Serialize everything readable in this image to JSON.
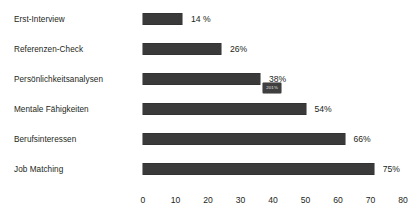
{
  "chart_data": {
    "type": "bar",
    "orientation": "horizontal",
    "title": "",
    "xlabel": "",
    "ylabel": "",
    "xlim": [
      0,
      80
    ],
    "xticks": [
      "0",
      "10",
      "20",
      "30",
      "40",
      "50",
      "60",
      "70",
      "80"
    ],
    "grid": false,
    "legend": "none",
    "bar_color": "#3a3a3a",
    "background_color": "#ffffff",
    "text_color": "#231f20",
    "categories": [
      "Erst-Interview",
      "Referenzen-Check",
      "Persönlichkeitsanalysen",
      "Mentale Fähigkeiten",
      "Berufsinteressen",
      "Job Matching"
    ],
    "values": [
      12,
      24,
      36,
      50,
      62,
      71
    ],
    "data_labels": [
      "14 %",
      "26%",
      "38%",
      "54%",
      "66%",
      "75%"
    ],
    "annotations": [
      {
        "text": "201%",
        "attached_to": "Mentale Fähigkeiten",
        "style": "tooltip-badge",
        "x_value": 37,
        "background_color": "#3f3f3f",
        "text_color": "#e8e8e8"
      }
    ]
  }
}
